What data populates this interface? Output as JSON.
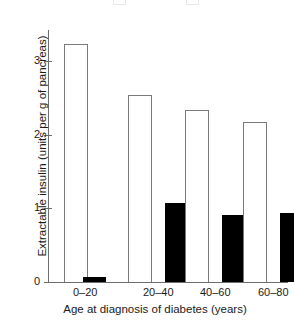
{
  "chart_data": {
    "type": "bar",
    "title": "",
    "subtitle": "",
    "xlabel": "Age at diagnosis of diabetes (years)",
    "ylabel": "Extractable insulin (units per g of pancreas)",
    "categories": [
      "0–20",
      "20–40",
      "40–60",
      "60–80"
    ],
    "ylim": [
      0,
      3.45
    ],
    "yticks": [
      0,
      1,
      2,
      3
    ],
    "ytick_labels": [
      "0",
      "1",
      "2",
      "3"
    ],
    "grid": false,
    "legend_position": "top (clipped off image)",
    "series": [
      {
        "name": "open-bars",
        "style": "outlined-white",
        "color": "#ffffff",
        "edge_color": "#7a7a7a",
        "values": [
          3.23,
          2.54,
          2.33,
          2.17
        ]
      },
      {
        "name": "filled-bars",
        "style": "solid-black",
        "color": "#000000",
        "edge_color": "#000000",
        "values": [
          0.07,
          1.07,
          0.91,
          0.94
        ]
      }
    ],
    "annotations": []
  },
  "axes": {
    "y_tick_labels": [
      "3",
      "2",
      "1",
      "0"
    ],
    "y_tick_values": [
      3,
      2,
      1,
      0
    ],
    "y_title": "Extractable insulin (units per g of pancreas)",
    "x_title": "Age at diagnosis of diabetes (years)",
    "x_group_labels": [
      "0–20",
      "20–40",
      "40–60",
      "60–80"
    ]
  },
  "colors": {
    "axis": "#6e6e6e",
    "bar_edge": "#7a7a7a",
    "bar_open_fill": "#ffffff",
    "bar_filled_fill": "#000000",
    "text": "#1a1a1a",
    "background": "#ffffff"
  }
}
